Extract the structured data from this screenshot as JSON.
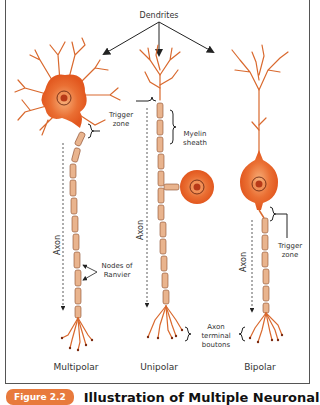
{
  "figure": {
    "labels": {
      "dendrites": "Dendrites",
      "trigger_zone_1": [
        "Trigger",
        "zone"
      ],
      "myelin_sheath": [
        "Myelin",
        "sheath"
      ],
      "axon": "Axon",
      "nodes_of_ranvier": [
        "Nodes of",
        "Ranvier"
      ],
      "trigger_zone_2": [
        "Trigger",
        "zone"
      ],
      "axon_terminal_boutons": [
        "Axon",
        "terminal",
        "boutons"
      ]
    },
    "neuron_types": [
      {
        "name": "Multipolar"
      },
      {
        "name": "Unipolar"
      },
      {
        "name": "Bipolar"
      }
    ],
    "colors": {
      "cell_body": "#e8652a",
      "dendrite": "#d9692e",
      "myelin": "#e9b48e",
      "nucleus": "#b83a18"
    }
  },
  "caption": {
    "badge": "Figure 2.2",
    "text": "Illustration of Multiple Neuronal"
  }
}
